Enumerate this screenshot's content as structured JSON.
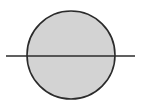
{
  "diagram": {
    "circle": {
      "cx": 71,
      "cy": 55,
      "r": 44,
      "fill": "#d3d3d3",
      "stroke": "#2b2b2b",
      "stroke_width": 1.6
    },
    "line": {
      "x1": 6,
      "y1": 56,
      "x2": 135,
      "y2": 56,
      "stroke": "#2b2b2b",
      "stroke_width": 1.4
    }
  }
}
